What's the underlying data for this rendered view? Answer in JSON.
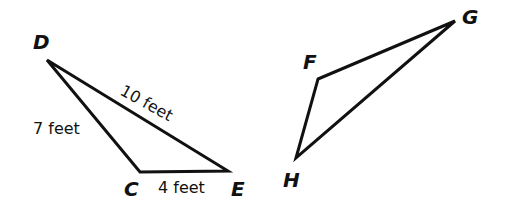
{
  "triangle_cde": {
    "vertices": {
      "D": "D",
      "C": "C",
      "E": "E"
    },
    "sides": {
      "DE": "10 feet",
      "DC": "7 feet",
      "CE": "4 feet"
    }
  },
  "triangle_fgh": {
    "vertices": {
      "F": "F",
      "G": "G",
      "H": "H"
    }
  },
  "colors": {
    "stroke": "#111111",
    "background": "#ffffff"
  }
}
